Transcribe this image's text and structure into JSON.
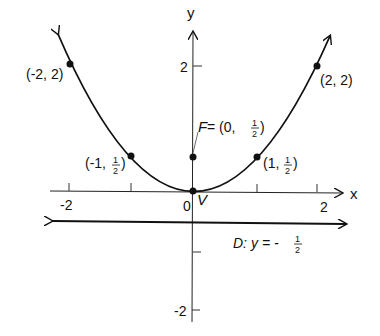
{
  "diagram": {
    "type": "parabola",
    "equation_hint": "y = (1/2)x^2",
    "axes": {
      "x_label": "x",
      "y_label": "y",
      "x_ticks": [
        "-2",
        "0",
        "2"
      ],
      "y_ticks": [
        "2",
        "-2"
      ]
    },
    "points": [
      {
        "label": "(-2, 2)",
        "x": -2,
        "y": 2
      },
      {
        "label": "(2, 2)",
        "x": 2,
        "y": 2
      },
      {
        "label": "(-1, ",
        "frac": "1/2",
        "x": -1,
        "y": 0.5
      },
      {
        "label": "(1, ",
        "frac": "1/2",
        "x": 1,
        "y": 0.5
      }
    ],
    "focus": {
      "prefix": "F",
      "eq": " = (0, ",
      "x": 0,
      "y": 0.5
    },
    "vertex": {
      "label": "V",
      "x": 0,
      "y": 0
    },
    "directrix": {
      "prefix": "D:",
      "eq": " y = -",
      "frac": "1/2",
      "y": -0.5
    },
    "fraction": {
      "num": "1",
      "den": "2"
    }
  }
}
